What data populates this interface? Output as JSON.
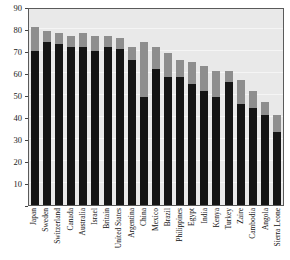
{
  "chart_data": {
    "type": "bar",
    "title": "",
    "xlabel": "",
    "ylabel": "",
    "ylim": [
      0,
      90
    ],
    "yticks": [
      0,
      10,
      20,
      30,
      40,
      50,
      60,
      70,
      80,
      90
    ],
    "ytick_labels": [
      "",
      "10",
      "20",
      "30",
      "40",
      "50",
      "60",
      "70",
      "80",
      "90"
    ],
    "grid": true,
    "stacked": true,
    "legend": "none",
    "colors": {
      "bottom": "#151515",
      "top": "#8e8e8e",
      "plot_background": "#e9e9e9",
      "frame": "#5a5a5a"
    },
    "categories": [
      "Japan",
      "Sweden",
      "Switzerland",
      "Canada",
      "Australia",
      "Israel",
      "Britain",
      "United States",
      "Argentina",
      "China",
      "Mexico",
      "Brazil",
      "Philippines",
      "Egypt",
      "India",
      "Kenya",
      "Turkey",
      "Zaire",
      "Cambodia",
      "Angola",
      "Sierra Leone"
    ],
    "series": [
      {
        "name": "lower",
        "values": [
          70,
          74,
          73,
          72,
          72,
          70,
          72,
          71,
          66,
          49,
          62,
          58,
          58,
          55,
          52,
          49,
          56,
          46,
          44,
          41,
          33
        ]
      },
      {
        "name": "upper",
        "values": [
          11,
          5,
          5,
          5,
          6,
          7,
          5,
          5,
          6,
          25,
          10,
          11,
          8,
          10,
          11,
          12,
          5,
          11,
          8,
          6,
          8
        ]
      }
    ],
    "totals": [
      81,
      79,
      78,
      77,
      78,
      77,
      77,
      76,
      72,
      74,
      72,
      69,
      66,
      65,
      63,
      61,
      61,
      57,
      52,
      47,
      41
    ]
  }
}
